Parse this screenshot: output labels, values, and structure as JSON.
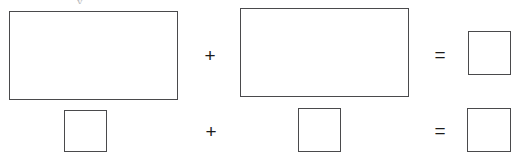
{
  "page": {
    "kind": "shape-equation-worksheet",
    "width": 522,
    "height": 164,
    "background_color": "#ffffff",
    "stroke_color": "#4a4a4c",
    "operator_color": "#1c1c1c",
    "artifact_color": "#b9b9bb"
  },
  "artifact": {
    "text": "y",
    "note": "faint cropped descender from a line of text above the crop"
  },
  "rows": [
    {
      "id": "row-1",
      "terms": [
        {
          "name": "rect-large-1",
          "shape": "rectangle",
          "label": "",
          "x": 9,
          "y": 11,
          "width": 169,
          "height": 89
        },
        {
          "name": "operator-plus-1",
          "shape": "operator",
          "label": "+",
          "x": 202,
          "y": 46,
          "width": 16,
          "height": 19
        },
        {
          "name": "rect-large-2",
          "shape": "rectangle",
          "label": "",
          "x": 240,
          "y": 8,
          "width": 169,
          "height": 89
        },
        {
          "name": "operator-equals-1",
          "shape": "operator",
          "label": "=",
          "x": 432,
          "y": 45,
          "width": 16,
          "height": 19
        },
        {
          "name": "square-small-1",
          "shape": "square",
          "label": "",
          "x": 468,
          "y": 31,
          "width": 43,
          "height": 44
        }
      ]
    },
    {
      "id": "row-2",
      "terms": [
        {
          "name": "square-small-2",
          "shape": "square",
          "label": "",
          "x": 64,
          "y": 110,
          "width": 43,
          "height": 42
        },
        {
          "name": "operator-plus-2",
          "shape": "operator",
          "label": "+",
          "x": 203,
          "y": 122,
          "width": 16,
          "height": 19
        },
        {
          "name": "square-small-3",
          "shape": "square",
          "label": "",
          "x": 298,
          "y": 108,
          "width": 43,
          "height": 44
        },
        {
          "name": "operator-equals-2",
          "shape": "operator",
          "label": "=",
          "x": 432,
          "y": 121,
          "width": 16,
          "height": 19
        },
        {
          "name": "square-small-4",
          "shape": "square",
          "label": "",
          "x": 467,
          "y": 108,
          "width": 44,
          "height": 44
        }
      ]
    }
  ]
}
